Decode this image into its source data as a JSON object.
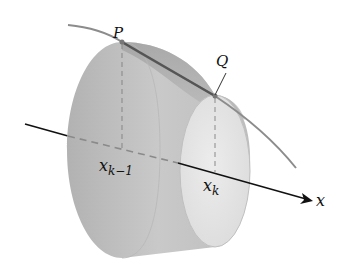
{
  "figure": {
    "labels": {
      "point_p": "P",
      "point_q": "Q",
      "x_left_base": "x",
      "x_left_sub": "k−1",
      "x_right_base": "x",
      "x_right_sub": "k",
      "axis": "x"
    },
    "colors": {
      "background": "#ffffff",
      "solid_dark": "#a9a9a9",
      "solid_mid": "#c4c4c4",
      "solid_light": "#e2e2e2",
      "curve": "#8c8c8c",
      "segment_pq": "#555555",
      "axis": "#111111",
      "dashes": "#9a9a9a"
    }
  }
}
